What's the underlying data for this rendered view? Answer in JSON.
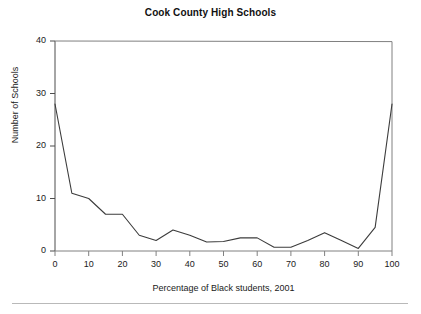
{
  "figure": {
    "title": "Cook County High Schools",
    "background_color": "#ffffff",
    "line_color": "#3c3c3c",
    "axis_color": "#4d4d4d"
  },
  "chart_data": {
    "type": "line",
    "title": "Cook County High Schools",
    "xlabel": "Percentage of Black students, 2001",
    "ylabel": "Number of Schools",
    "xlim": [
      0,
      100
    ],
    "ylim": [
      0,
      40
    ],
    "xticks": [
      0,
      10,
      20,
      30,
      40,
      50,
      60,
      70,
      80,
      90,
      100
    ],
    "yticks": [
      0,
      10,
      20,
      30,
      40
    ],
    "xtick_labels": [
      "0",
      "10",
      "20",
      "30",
      "40",
      "50",
      "60",
      "70",
      "80",
      "90",
      "100"
    ],
    "ytick_labels": [
      "0",
      "10",
      "20",
      "30",
      "40"
    ],
    "grid": false,
    "legend": false,
    "x": [
      0,
      5,
      10,
      15,
      20,
      25,
      30,
      35,
      40,
      45,
      50,
      55,
      60,
      65,
      70,
      75,
      80,
      85,
      90,
      95,
      100
    ],
    "values": [
      28,
      11,
      10,
      7,
      7,
      3,
      2,
      4,
      3,
      1.7,
      1.8,
      2.5,
      2.5,
      0.7,
      0.7,
      2,
      3.5,
      2,
      0.5,
      4.5,
      28
    ],
    "series": [
      {
        "name": "Number of Schools",
        "values": [
          28,
          11,
          10,
          7,
          7,
          3,
          2,
          4,
          3,
          1.7,
          1.8,
          2.5,
          2.5,
          0.7,
          0.7,
          2,
          3.5,
          2,
          0.5,
          4.5,
          28
        ]
      }
    ]
  }
}
